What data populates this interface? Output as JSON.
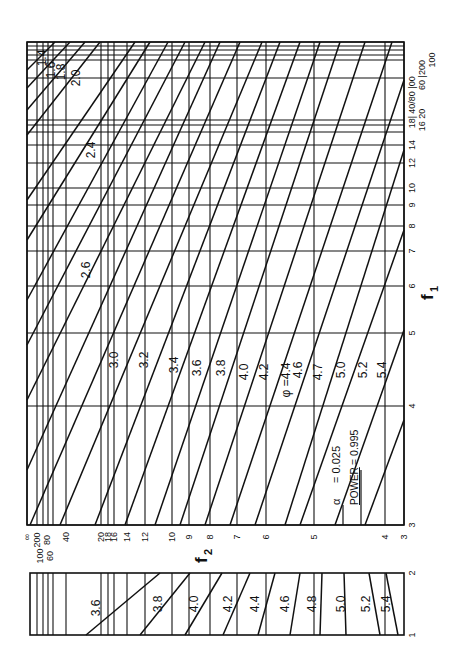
{
  "chart_data": {
    "type": "line",
    "annotation": {
      "alpha_label": "α",
      "alpha_value": "= 0.025",
      "power_label": "POWER",
      "power_value": "= 0.995"
    },
    "xlabel": "f1",
    "ylabel": "f2",
    "phi_symbol": "φ",
    "main_panel": {
      "f1_ticks": [
        "∞",
        "200",
        "100",
        "80",
        "60",
        "40",
        "20",
        "18",
        "16",
        "14",
        "12",
        "10",
        "9",
        "8",
        "7",
        "6",
        "5",
        "4",
        "3"
      ],
      "f2_ticks": [
        "∞",
        "200",
        "100",
        "80",
        "60",
        "40",
        "20",
        "18",
        "16",
        "14",
        "12",
        "10",
        "9",
        "8",
        "7",
        "6",
        "5",
        "4",
        "3"
      ],
      "phi_curves": [
        "1.4",
        "1.6",
        "1.8",
        "2.0",
        "2.4",
        "2.6",
        "3.0",
        "3.2",
        "3.4",
        "3.6",
        "3.8",
        "4.0",
        "4.2",
        "4.4",
        "4.6",
        "4.7",
        "5.0",
        "5.2",
        "5.4"
      ],
      "phi_label_prefix": "φ =4.4"
    },
    "strip_panel": {
      "f1_ticks": [
        "2",
        "1"
      ],
      "f2_ticks": [
        "∞",
        "200",
        "100",
        "80",
        "60",
        "40"
      ],
      "phi_curves": [
        "3.6",
        "3.8",
        "4.0",
        "4.2",
        "4.4",
        "4.6",
        "4.8",
        "5.0",
        "5.2",
        "5.4"
      ]
    },
    "f1_axis_label": "f",
    "f1_axis_sub": "1",
    "f2_axis_label": "f",
    "f2_axis_sub": "2"
  },
  "labels": {
    "f1_top_group": "40/80 |00",
    "f1_top_group2": "60 |200",
    "f1_top_group3": "100",
    "f1_mid_group": "18|",
    "f1_mid_group2": "16 20",
    "f2_left_group": "∞ 200 80 40",
    "f2_left_group2": "100 60"
  }
}
